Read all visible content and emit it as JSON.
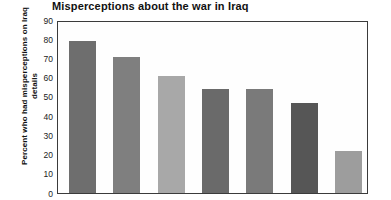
{
  "chart_data": {
    "type": "bar",
    "title": "Misperceptions about the war in Iraq",
    "xlabel": "",
    "ylabel": "Percent who had misperceptions on Iraq details",
    "ylim": [
      0,
      90
    ],
    "yticks": [
      90,
      80,
      70,
      60,
      50,
      40,
      30,
      20,
      10,
      0
    ],
    "ytick_labels": [
      "90",
      "80",
      "70",
      "60",
      "50",
      "40",
      "30",
      "20",
      "10",
      "0"
    ],
    "grid": false,
    "legend": false,
    "categories": [
      "",
      "",
      "",
      "",
      "",
      "",
      ""
    ],
    "values": [
      79,
      71,
      61,
      54,
      54,
      47,
      22
    ],
    "bar_colors": [
      "#6e6e6e",
      "#7f7f7f",
      "#a8a8a8",
      "#6a6a6a",
      "#7a7a7a",
      "#565656",
      "#9d9d9d"
    ]
  },
  "figure": {
    "background_color": "#ffffff",
    "frame_color": "#3b3b3b"
  }
}
